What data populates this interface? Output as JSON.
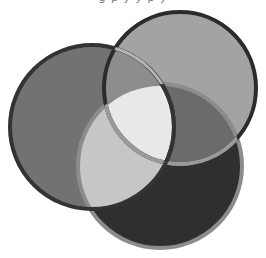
{
  "diagram": {
    "type": "venn",
    "sets": [
      {
        "id": "left",
        "cx": 92,
        "cy": 127,
        "r": 82,
        "fill": "#727272",
        "stroke": "#333333"
      },
      {
        "id": "right",
        "cx": 180,
        "cy": 88,
        "r": 76,
        "fill": "#a3a3a3",
        "stroke": "#2b2b2b"
      },
      {
        "id": "bottom",
        "cx": 160,
        "cy": 166,
        "r": 82,
        "fill": "#2f2f2f",
        "stroke": "#8c8c8c"
      }
    ],
    "intersections": {
      "left_right": "#8d8d8d",
      "right_bottom": "#6b6b6b",
      "left_bottom": "#c6c6c6",
      "all": "#e8e8e8"
    },
    "top_text_cropped": "g   p   y  y    p     y"
  }
}
